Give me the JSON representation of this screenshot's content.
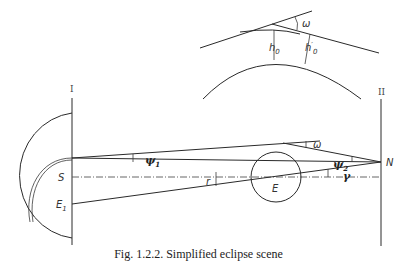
{
  "figure": {
    "caption": "Fig. 1.2.2. Simplified eclipse scene"
  },
  "labels": {
    "plane_1": "I",
    "plane_2": "II",
    "sun": "S",
    "earth": "E",
    "earth_1": "E",
    "earth_1_sub": "1",
    "observer": "N",
    "psi_1": "ψ",
    "psi_1_sub": "1",
    "psi_2": "ψ",
    "psi_2_sub": "2",
    "omega_main": "ω",
    "omega_inset": "ω",
    "r": "r",
    "gamma": "γ",
    "h0": "h",
    "h0_sub": "0",
    "h0_prime": "h",
    "h0_prime_sub": "0",
    "h0_prime_mark": "′"
  },
  "colors": {
    "line": "#2a2a2a",
    "background": "#ffffff"
  }
}
